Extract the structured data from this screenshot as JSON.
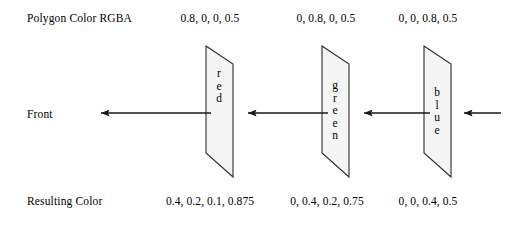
{
  "diagram": {
    "title_row_label": "Polygon Color RGBA",
    "middle_row_label": "Front",
    "bottom_row_label": "Resulting Color",
    "background_color": "#ffffff",
    "stroke_color": "#2a2a2a",
    "plane_fill_color": "#f5f5f5",
    "planes": [
      {
        "name": "red",
        "label": "red",
        "letters": [
          "r",
          "e",
          "d"
        ],
        "polygon_color_rgba": "0.8, 0, 0, 0.5",
        "resulting_color_rgba": "0.4, 0.2, 0.1, 0.875"
      },
      {
        "name": "green",
        "label": "green",
        "letters": [
          "g",
          "r",
          "e",
          "e",
          "n"
        ],
        "polygon_color_rgba": "0, 0.8, 0, 0.5",
        "resulting_color_rgba": "0, 0.4, 0.2, 0.75"
      },
      {
        "name": "blue",
        "label": "blue",
        "letters": [
          "b",
          "l",
          "u",
          "e"
        ],
        "polygon_color_rgba": "0, 0, 0.8, 0.5",
        "resulting_color_rgba": "0, 0, 0.4, 0.5"
      }
    ],
    "arrows": [
      {
        "name": "arrow-to-front",
        "direction": "left"
      },
      {
        "name": "arrow-red-to-green",
        "direction": "left"
      },
      {
        "name": "arrow-green-to-blue",
        "direction": "left"
      },
      {
        "name": "arrow-into-blue",
        "direction": "left"
      }
    ]
  }
}
